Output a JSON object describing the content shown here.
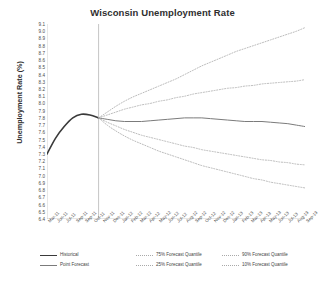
{
  "chart": {
    "title": "Wisconsin Unemployment Rate",
    "ylabel": "Unemployment Rate (%)",
    "xlabel": ""
  },
  "legend": {
    "items": [
      {
        "label": "Historical",
        "key": "solid-dark",
        "col": 0,
        "row": 0
      },
      {
        "label": "Point Forecast",
        "key": "solid-grey",
        "col": 0,
        "row": 1
      },
      {
        "label": "75% Forecast Quantile",
        "key": "dotted",
        "col": 1,
        "row": 0
      },
      {
        "label": "25% Forecast Quantile",
        "key": "dotted",
        "col": 1,
        "row": 1
      },
      {
        "label": "90% Forecast Quantile",
        "key": "dotted",
        "col": 2,
        "row": 0
      },
      {
        "label": "10% Forecast Quantile",
        "key": "dotted",
        "col": 2,
        "row": 1
      }
    ]
  },
  "chart_data": {
    "type": "line",
    "title": "Wisconsin Unemployment Rate",
    "xlabel": "",
    "ylabel": "Unemployment Rate (%)",
    "ylim": [
      6.4,
      9.1
    ],
    "ytick_step": 0.1,
    "yticks": [
      9.1,
      9.0,
      8.9,
      8.8,
      8.7,
      8.6,
      8.5,
      8.4,
      8.3,
      8.2,
      8.1,
      8.0,
      7.9,
      7.8,
      7.7,
      7.6,
      7.5,
      7.4,
      7.3,
      7.2,
      7.1,
      7.0,
      6.9,
      6.8,
      6.7,
      6.6,
      6.5,
      6.4
    ],
    "grid": false,
    "legend_position": "bottom",
    "forecast_origin": "Sep-11",
    "forecast_origin_value": 7.8,
    "annotations": [
      {
        "type": "vline",
        "x": "Sep-11",
        "note": "forecast origin divider"
      }
    ],
    "categories": [
      "Mar-11",
      "Apr-11",
      "May-11",
      "Jun-11",
      "Jul-11",
      "Aug-11",
      "Sep-11",
      "Oct-11",
      "Nov-11",
      "Dec-11",
      "Jan-12",
      "Feb-12",
      "Mar-12",
      "Apr-12",
      "May-12",
      "Jun-12",
      "Jul-12",
      "Aug-12",
      "Sep-12",
      "Oct-12",
      "Nov-12",
      "Dec-12",
      "Jan-13",
      "Feb-13",
      "Mar-13",
      "Apr-13",
      "May-13",
      "Jun-13",
      "Jul-13",
      "Aug-13",
      "Sep-13"
    ],
    "xtick_labels": [
      "Mar-11",
      "Jun-11",
      "Jul-11",
      "Sep-11",
      "Sep-11",
      "Oct-11",
      "Nov-11",
      "Dec-11",
      "Jan-12",
      "Feb-12",
      "Mar-12",
      "Apr-12",
      "May-12",
      "Jun-12",
      "Jul-12",
      "Aug-12",
      "Sep-12",
      "Oct-12",
      "Nov-12",
      "Dec-12",
      "Jan-13",
      "Feb-13",
      "Mar-13",
      "Apr-13",
      "May-13",
      "Jun-13",
      "Jul-13",
      "Aug-13",
      "Sep-13"
    ],
    "series": [
      {
        "name": "Historical",
        "style": "solid",
        "color": "#3a3a3a",
        "x": [
          "Mar-11",
          "Apr-11",
          "May-11",
          "Jun-11",
          "Jul-11",
          "Aug-11",
          "Sep-11"
        ],
        "values": [
          7.3,
          7.52,
          7.68,
          7.8,
          7.85,
          7.84,
          7.8
        ]
      },
      {
        "name": "Point Forecast",
        "style": "solid",
        "color": "#7b7b7b",
        "x": [
          "Sep-11",
          "Oct-11",
          "Nov-11",
          "Dec-11",
          "Jan-12",
          "Feb-12",
          "Mar-12",
          "Apr-12",
          "May-12",
          "Jun-12",
          "Jul-12",
          "Aug-12",
          "Sep-12",
          "Oct-12",
          "Nov-12",
          "Dec-12",
          "Jan-13",
          "Feb-13",
          "Mar-13",
          "Apr-13",
          "May-13",
          "Jun-13",
          "Jul-13",
          "Aug-13",
          "Sep-13"
        ],
        "values": [
          7.8,
          7.78,
          7.76,
          7.75,
          7.75,
          7.75,
          7.76,
          7.77,
          7.78,
          7.79,
          7.8,
          7.8,
          7.8,
          7.79,
          7.78,
          7.77,
          7.76,
          7.75,
          7.75,
          7.75,
          7.74,
          7.73,
          7.72,
          7.7,
          7.68
        ]
      },
      {
        "name": "90% Forecast Quantile",
        "style": "dotted",
        "color": "#a9a9a9",
        "x": [
          "Sep-11",
          "Oct-11",
          "Nov-11",
          "Dec-11",
          "Jan-12",
          "Feb-12",
          "Mar-12",
          "Apr-12",
          "May-12",
          "Jun-12",
          "Jul-12",
          "Aug-12",
          "Sep-12",
          "Oct-12",
          "Nov-12",
          "Dec-12",
          "Jan-13",
          "Feb-13",
          "Mar-13",
          "Apr-13",
          "May-13",
          "Jun-13",
          "Jul-13",
          "Aug-13",
          "Sep-13"
        ],
        "values": [
          7.8,
          7.88,
          7.96,
          8.03,
          8.09,
          8.14,
          8.19,
          8.24,
          8.29,
          8.34,
          8.4,
          8.46,
          8.52,
          8.57,
          8.62,
          8.67,
          8.72,
          8.76,
          8.8,
          8.84,
          8.88,
          8.92,
          8.96,
          9.0,
          9.05
        ]
      },
      {
        "name": "75% Forecast Quantile",
        "style": "dotted",
        "color": "#a9a9a9",
        "x": [
          "Sep-11",
          "Oct-11",
          "Nov-11",
          "Dec-11",
          "Jan-12",
          "Feb-12",
          "Mar-12",
          "Apr-12",
          "May-12",
          "Jun-12",
          "Jul-12",
          "Aug-12",
          "Sep-12",
          "Oct-12",
          "Nov-12",
          "Dec-12",
          "Jan-13",
          "Feb-13",
          "Mar-13",
          "Apr-13",
          "May-13",
          "Jun-13",
          "Jul-13",
          "Aug-13",
          "Sep-13"
        ],
        "values": [
          7.8,
          7.84,
          7.88,
          7.92,
          7.95,
          7.98,
          8.0,
          8.03,
          8.05,
          8.08,
          8.1,
          8.13,
          8.15,
          8.17,
          8.19,
          8.21,
          8.22,
          8.24,
          8.25,
          8.27,
          8.28,
          8.29,
          8.3,
          8.31,
          8.33
        ]
      },
      {
        "name": "25% Forecast Quantile",
        "style": "dotted",
        "color": "#a9a9a9",
        "x": [
          "Sep-11",
          "Oct-11",
          "Nov-11",
          "Dec-11",
          "Jan-12",
          "Feb-12",
          "Mar-12",
          "Apr-12",
          "May-12",
          "Jun-12",
          "Jul-12",
          "Aug-12",
          "Sep-12",
          "Oct-12",
          "Nov-12",
          "Dec-12",
          "Jan-13",
          "Feb-13",
          "Mar-13",
          "Apr-13",
          "May-13",
          "Jun-13",
          "Jul-13",
          "Aug-13",
          "Sep-13"
        ],
        "values": [
          7.8,
          7.74,
          7.69,
          7.64,
          7.6,
          7.56,
          7.53,
          7.5,
          7.47,
          7.44,
          7.41,
          7.39,
          7.36,
          7.34,
          7.32,
          7.3,
          7.28,
          7.26,
          7.24,
          7.22,
          7.21,
          7.19,
          7.18,
          7.16,
          7.15
        ]
      },
      {
        "name": "10% Forecast Quantile",
        "style": "dotted",
        "color": "#a9a9a9",
        "x": [
          "Sep-11",
          "Oct-11",
          "Nov-11",
          "Dec-11",
          "Jan-12",
          "Feb-12",
          "Mar-12",
          "Apr-12",
          "May-12",
          "Jun-12",
          "Jul-12",
          "Aug-12",
          "Sep-12",
          "Oct-12",
          "Nov-12",
          "Dec-12",
          "Jan-13",
          "Feb-13",
          "Mar-13",
          "Apr-13",
          "May-13",
          "Jun-13",
          "Jul-13",
          "Aug-13",
          "Sep-13"
        ],
        "values": [
          7.8,
          7.7,
          7.62,
          7.55,
          7.49,
          7.44,
          7.39,
          7.34,
          7.3,
          7.26,
          7.22,
          7.18,
          7.14,
          7.11,
          7.08,
          7.05,
          7.02,
          6.99,
          6.96,
          6.94,
          6.91,
          6.89,
          6.87,
          6.85,
          6.83
        ]
      }
    ]
  }
}
